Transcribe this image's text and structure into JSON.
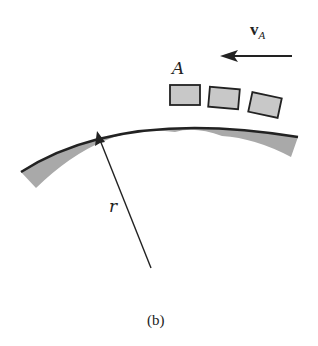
{
  "diagram": {
    "labels": {
      "block_label": "A",
      "velocity_symbol": "v",
      "velocity_subscript": "A",
      "radius_label": "r",
      "caption": "(b)"
    },
    "elements": {
      "surface": "curved track segment (shaded)",
      "blocks": [
        "block-1",
        "block-2",
        "block-3"
      ],
      "velocity_arrow": "points left",
      "radius_arrow": "from center up to curve"
    },
    "colors": {
      "fill_gray": "#a9a9a9",
      "block_fill": "#c8c8c8",
      "stroke": "#222222",
      "background": "#ffffff"
    }
  }
}
